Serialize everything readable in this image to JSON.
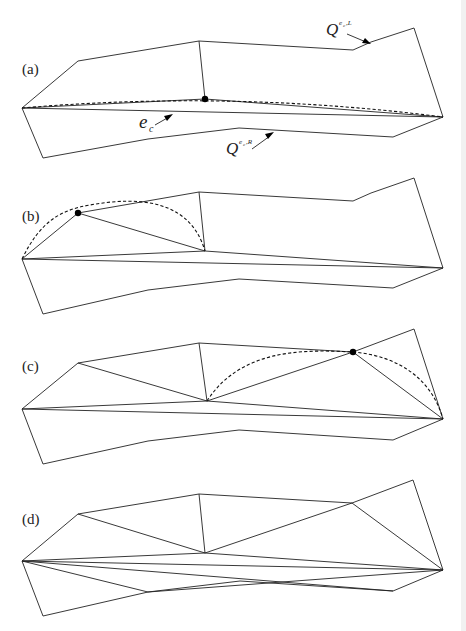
{
  "figure": {
    "panels": [
      {
        "id": "a",
        "label": "(a)"
      },
      {
        "id": "b",
        "label": "(b)"
      },
      {
        "id": "c",
        "label": "(c)"
      },
      {
        "id": "d",
        "label": "(d)"
      }
    ],
    "annotations": {
      "upper_polygon": {
        "base": "Q",
        "superscript": "e",
        "sub_sup": "c",
        "suffix": ",L"
      },
      "lower_polygon": {
        "base": "Q",
        "superscript": "e",
        "sub_sup": "c",
        "suffix": ",R"
      },
      "edge": {
        "base": "e",
        "subscript": "c"
      }
    },
    "colors": {
      "line": "#222222",
      "background": "#ffffff",
      "point": "#000000"
    }
  }
}
